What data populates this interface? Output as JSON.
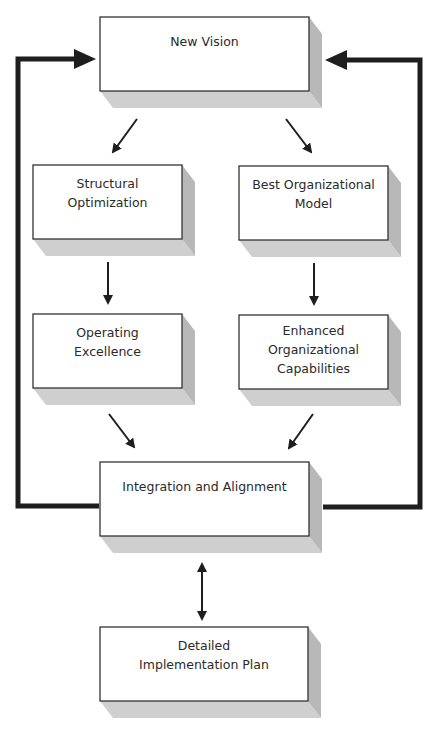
{
  "diagram": {
    "colors": {
      "box_fill": "#ffffff",
      "box_border": "#333333",
      "shadow_bottom": "#cfcfcf",
      "shadow_side": "#b8b8b8",
      "line": "#1e1e1e"
    },
    "nodes": [
      {
        "id": "new-vision",
        "lines": [
          "New Vision"
        ],
        "x": 100,
        "y": 17,
        "w": 209,
        "h": 74
      },
      {
        "id": "structural-optimization",
        "lines": [
          "Structural",
          "Optimization"
        ],
        "x": 33,
        "y": 165,
        "w": 149,
        "h": 74
      },
      {
        "id": "best-organizational-model",
        "lines": [
          "Best Organizational",
          "Model"
        ],
        "x": 239,
        "y": 166,
        "w": 149,
        "h": 74
      },
      {
        "id": "operating-excellence",
        "lines": [
          "Operating",
          "Excellence"
        ],
        "x": 33,
        "y": 314,
        "w": 149,
        "h": 74
      },
      {
        "id": "enhanced-organizational-capabilities",
        "lines": [
          "Enhanced",
          "Organizational",
          "Capabilities"
        ],
        "x": 239,
        "y": 315,
        "w": 149,
        "h": 74
      },
      {
        "id": "integration-and-alignment",
        "lines": [
          "Integration and Alignment"
        ],
        "x": 100,
        "y": 462,
        "w": 209,
        "h": 74
      },
      {
        "id": "detailed-implementation-plan",
        "lines": [
          "Detailed",
          "Implementation Plan"
        ],
        "x": 100,
        "y": 627,
        "w": 208,
        "h": 74
      }
    ],
    "edges": [
      {
        "from": "new-vision",
        "to": "structural-optimization",
        "type": "arrow"
      },
      {
        "from": "new-vision",
        "to": "best-organizational-model",
        "type": "arrow"
      },
      {
        "from": "structural-optimization",
        "to": "operating-excellence",
        "type": "arrow"
      },
      {
        "from": "best-organizational-model",
        "to": "enhanced-organizational-capabilities",
        "type": "arrow"
      },
      {
        "from": "operating-excellence",
        "to": "integration-and-alignment",
        "type": "arrow"
      },
      {
        "from": "enhanced-organizational-capabilities",
        "to": "integration-and-alignment",
        "type": "arrow"
      },
      {
        "from": "integration-and-alignment",
        "to": "detailed-implementation-plan",
        "type": "bidirectional"
      },
      {
        "from": "integration-and-alignment",
        "to": "new-vision",
        "type": "feedback-loop-left"
      },
      {
        "from": "integration-and-alignment",
        "to": "new-vision",
        "type": "feedback-loop-right"
      }
    ]
  },
  "labels": {
    "new_vision": [
      "New Vision"
    ],
    "structural_optimization": [
      "Structural",
      "Optimization"
    ],
    "best_organizational_model": [
      "Best Organizational",
      "Model"
    ],
    "operating_excellence": [
      "Operating",
      "Excellence"
    ],
    "enhanced_organizational_capabilities": [
      "Enhanced",
      "Organizational",
      "Capabilities"
    ],
    "integration_and_alignment": [
      "Integration and Alignment"
    ],
    "detailed_implementation_plan": [
      "Detailed",
      "Implementation Plan"
    ]
  }
}
